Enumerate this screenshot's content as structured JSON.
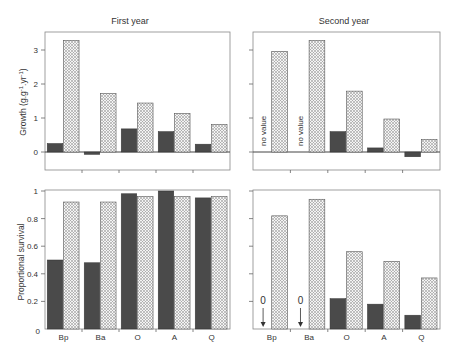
{
  "colors": {
    "dark": "#4a4a4a",
    "hatch_bg": "#f4f4f4",
    "hatch_line": "#8a8a8a",
    "axis": "#555555",
    "text": "#333333"
  },
  "titles": {
    "left": "First year",
    "right": "Second year"
  },
  "axes": {
    "growth_label": "Growth (g.g⁻¹.yr⁻¹)",
    "survival_label": "Proportional survival",
    "growth_ticks": [
      "0",
      "1",
      "2",
      "3"
    ],
    "survival_ticks": [
      "0",
      "0.2",
      "0.4",
      "0.6",
      "0.8",
      "1"
    ]
  },
  "annotations": {
    "no_value": "no value",
    "zero": "0"
  },
  "chart_data": [
    {
      "type": "bar",
      "panel": "top-left",
      "title": "First year",
      "ylabel": "Growth (g.g-1.yr-1)",
      "categories": [
        "Bp",
        "Ba",
        "O",
        "A",
        "Q"
      ],
      "ylim": [
        -0.5,
        3.5
      ],
      "series": [
        {
          "name": "dark",
          "values": [
            0.25,
            -0.07,
            0.68,
            0.6,
            0.23
          ]
        },
        {
          "name": "hatched",
          "values": [
            3.28,
            1.72,
            1.44,
            1.13,
            0.81
          ]
        }
      ]
    },
    {
      "type": "bar",
      "panel": "top-right",
      "title": "Second year",
      "ylabel": "Growth (g.g-1.yr-1)",
      "categories": [
        "Bp",
        "Ba",
        "O",
        "A",
        "Q"
      ],
      "ylim": [
        -0.5,
        3.5
      ],
      "series": [
        {
          "name": "dark",
          "values": [
            null,
            null,
            0.6,
            0.12,
            -0.14
          ]
        },
        {
          "name": "hatched",
          "values": [
            2.96,
            3.28,
            1.79,
            0.97,
            0.37
          ]
        }
      ],
      "annotations": [
        "no value (Bp)",
        "no value (Ba)"
      ]
    },
    {
      "type": "bar",
      "panel": "bottom-left",
      "ylabel": "Proportional survival",
      "categories": [
        "Bp",
        "Ba",
        "O",
        "A",
        "Q"
      ],
      "ylim": [
        0,
        1
      ],
      "series": [
        {
          "name": "dark",
          "values": [
            0.5,
            0.48,
            0.98,
            1.0,
            0.95
          ]
        },
        {
          "name": "hatched",
          "values": [
            0.92,
            0.92,
            0.96,
            0.96,
            0.96
          ]
        }
      ]
    },
    {
      "type": "bar",
      "panel": "bottom-right",
      "ylabel": "Proportional survival",
      "categories": [
        "Bp",
        "Ba",
        "O",
        "A",
        "Q"
      ],
      "ylim": [
        0,
        1
      ],
      "series": [
        {
          "name": "dark",
          "values": [
            0,
            0,
            0.22,
            0.18,
            0.1
          ]
        },
        {
          "name": "hatched",
          "values": [
            0.82,
            0.94,
            0.56,
            0.49,
            0.37
          ]
        }
      ],
      "annotations": [
        "0 with down arrow (Bp)",
        "0 with down arrow (Ba)"
      ]
    }
  ]
}
